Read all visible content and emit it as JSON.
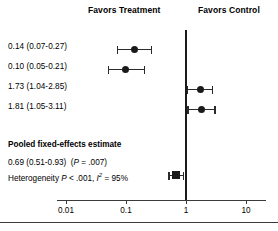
{
  "header": {
    "left_label": "Favors Treatment",
    "right_label": "Favors Control"
  },
  "chart_data": {
    "type": "forest",
    "title": "",
    "xlabel": "",
    "ylabel": "",
    "scale": "log",
    "xlim": [
      0.0068,
      14.0
    ],
    "null_value": 1,
    "grid": false,
    "legend": "none",
    "axis": {
      "ticks": [
        0.01,
        0.1,
        1,
        10
      ],
      "tick_labels": [
        "0.01",
        "0.1",
        "1",
        "10"
      ]
    },
    "studies": [
      {
        "label": "0.14 (0.07-0.27)",
        "estimate": 0.14,
        "ci_lower": 0.07,
        "ci_upper": 0.27,
        "marker": "circle"
      },
      {
        "label": "0.10 (0.05-0.21)",
        "estimate": 0.1,
        "ci_lower": 0.05,
        "ci_upper": 0.21,
        "marker": "circle"
      },
      {
        "label": "1.73 (1.04-2.85)",
        "estimate": 1.73,
        "ci_lower": 1.04,
        "ci_upper": 2.85,
        "marker": "circle"
      },
      {
        "label": "1.81 (1.05-3.11)",
        "estimate": 1.81,
        "ci_lower": 1.05,
        "ci_upper": 3.11,
        "marker": "circle"
      }
    ],
    "pooled": {
      "title": "Pooled fixed-effects estimate",
      "label": "0.69 (0.51-0.93)",
      "p_prefix": "P",
      "p_value": " = .007",
      "estimate": 0.69,
      "ci_lower": 0.51,
      "ci_upper": 0.93,
      "marker": "diamond",
      "heterogeneity": {
        "prefix": "Heterogeneity ",
        "p_symbol": "P",
        "p_text": " < .001, ",
        "i_symbol": "I",
        "i_exponent": "2",
        "i_text": " = 95%"
      }
    },
    "colors": {
      "marker": "#1a1a1a",
      "line": "#2b2b2b",
      "axis": "#3a3a3a",
      "text": "#000000",
      "background": "#ffffff"
    }
  }
}
